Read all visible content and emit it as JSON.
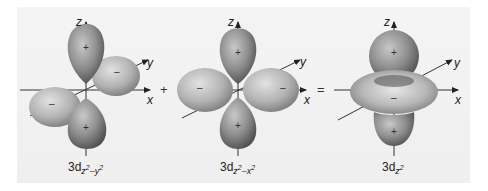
{
  "figure": {
    "orbitals": [
      {
        "id": "3dz2-y2",
        "label_base": "3d",
        "label_sub_a": "z",
        "label_sup_a": "2",
        "label_mid": "–y",
        "label_sup_b": "2",
        "axes": {
          "z": "z",
          "y": "y",
          "x": "x"
        },
        "lobe_signs": {
          "top": "+",
          "bottom": "+",
          "back_right": "–",
          "front_left": "–"
        }
      },
      {
        "id": "3dz2-x2",
        "label_base": "3d",
        "label_sub_a": "z",
        "label_sup_a": "2",
        "label_mid": "–x",
        "label_sup_b": "2",
        "axes": {
          "z": "z",
          "y": "y",
          "x": "x"
        },
        "lobe_signs": {
          "top": "+",
          "bottom": "+",
          "left": "–",
          "right": "–"
        }
      },
      {
        "id": "3dz2",
        "label_base": "3d",
        "label_sub_a": "z",
        "label_sup_a": "2",
        "axes": {
          "z": "z",
          "y": "y",
          "x": "x"
        },
        "lobe_signs": {
          "top": "+",
          "bottom": "+",
          "torus": "–"
        }
      }
    ],
    "operators": {
      "plus": "+",
      "equals": "="
    },
    "colors": {
      "background": "#f1f1f1",
      "positive_lobe": "#8a8a8a",
      "negative_lobe": "#b4b4b4",
      "axis": "#333333"
    }
  }
}
